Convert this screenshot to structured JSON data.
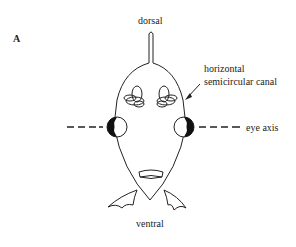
{
  "figure": {
    "panel_label": "A",
    "labels": {
      "top": "dorsal",
      "bottom": "ventral",
      "canal_line1": "horizontal",
      "canal_line2": "semicircular canal",
      "axis": "eye axis"
    },
    "colors": {
      "stroke": "#222222",
      "background": "#ffffff"
    }
  }
}
